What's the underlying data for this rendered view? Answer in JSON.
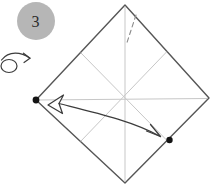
{
  "figure": {
    "step_number": "3"
  },
  "icons": {
    "step_badge": "gray-circle-step-number",
    "turn_over_icon": "loop-arrow (turn model over)",
    "fold_unfold_arrow": "curved arrow with open unfold head on left and barbed head on right",
    "landmark_dots": "two black reference dots on the paper corners/edge",
    "dashed_crease": "short dashed fold line near top corner"
  },
  "colors": {
    "background": "#ffffff",
    "badge_fill": "#b6b6b6",
    "badge_text": "#2b2b2b",
    "paper_outline": "#565656",
    "paper_fill": "#ffffff",
    "crease": "#c7c7c7",
    "dashed_line": "#8a8a8a",
    "arrow": "#3c3c3c",
    "dot": "#141414"
  }
}
